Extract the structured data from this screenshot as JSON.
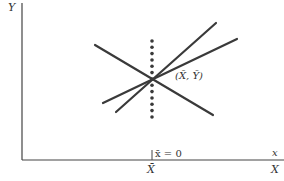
{
  "diagram": {
    "type": "regression-lines-through-mean-point",
    "axes": {
      "y_label": "Y",
      "x_label_upper": "x",
      "x_label_lower": "X"
    },
    "mean_point_label": "(X̄, Ȳ)",
    "mean_x_tick_label": "X̄",
    "centered_origin_label": "x̄ = 0",
    "lines": [
      {
        "name": "descending-line",
        "from": [
          95,
          45
        ],
        "to": [
          213,
          115
        ]
      },
      {
        "name": "steep-ascending-line",
        "from": [
          116,
          112
        ],
        "to": [
          216,
          23
        ]
      },
      {
        "name": "shallow-ascending-line",
        "from": [
          103,
          103
        ],
        "to": [
          237,
          39
        ]
      }
    ],
    "dotted_vertical": {
      "x": 152,
      "y_from": 41,
      "y_to": 117,
      "dots": 13
    },
    "colors": {
      "line": "#3a3a3a",
      "axis": "#444444",
      "text": "#333333"
    }
  }
}
